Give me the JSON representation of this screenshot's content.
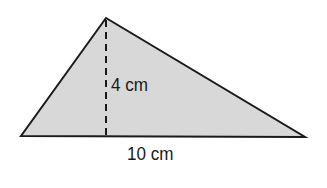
{
  "diagram": {
    "shape": "triangle",
    "fill_color": "#d8d8d8",
    "stroke_color": "#1a1a1a",
    "vertices": {
      "apex": [
        106,
        18
      ],
      "bottom_left": [
        21,
        136
      ],
      "bottom_right": [
        305,
        137
      ]
    },
    "height_label": "4 cm",
    "base_label": "10 cm"
  }
}
